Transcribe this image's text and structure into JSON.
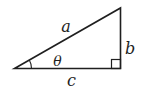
{
  "figure": {
    "type": "right-triangle-diagram",
    "labels": {
      "hypotenuse": "a",
      "opposite": "b",
      "adjacent": "c",
      "angle": "θ"
    },
    "colors": {
      "stroke": "#1f1f1f",
      "background": "#ffffff"
    }
  }
}
